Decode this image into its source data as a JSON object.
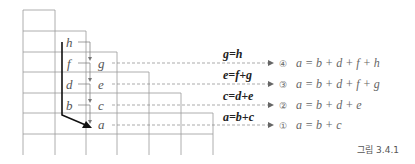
{
  "diagram": {
    "left_column_vars": [
      "h",
      "f",
      "d",
      "b"
    ],
    "right_column_vars": [
      "g",
      "e",
      "c",
      "a"
    ],
    "equations": [
      {
        "rule": "g=h",
        "index": "④",
        "result": "a = b + d + f + h"
      },
      {
        "rule": "e=f+g",
        "index": "③",
        "result": "a = b + d + f + g"
      },
      {
        "rule": "c=d+e",
        "index": "②",
        "result": "a = b + d + e"
      },
      {
        "rule": "a=b+c",
        "index": "①",
        "result": "a = b + c"
      }
    ],
    "caption": "그림 3.4.1"
  }
}
